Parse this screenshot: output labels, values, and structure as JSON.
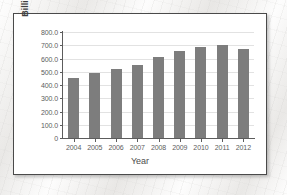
{
  "chart_data": {
    "type": "bar",
    "title": "",
    "xlabel": "Year",
    "ylabel": "Billions of dollars",
    "categories": [
      "2004",
      "2005",
      "2006",
      "2007",
      "2008",
      "2009",
      "2010",
      "2011",
      "2012"
    ],
    "values": [
      450.0,
      490.0,
      520.0,
      550.0,
      615.0,
      655.0,
      690.0,
      705.0,
      675.0
    ],
    "ylim": [
      0,
      800
    ],
    "ytick_values": [
      0,
      100,
      200,
      300,
      400,
      500,
      600,
      700,
      800
    ],
    "ytick_labels": [
      "0",
      "100.0",
      "200.0",
      "300.0",
      "400.0",
      "500.0",
      "600.0",
      "700.0",
      "800.0"
    ],
    "grid": true,
    "legend": "none",
    "bar_color": "#7d7d7d",
    "axis_color": "#5c5c5c",
    "gridline_color": "#e2e2e2",
    "plot_background": "#ffffff"
  }
}
